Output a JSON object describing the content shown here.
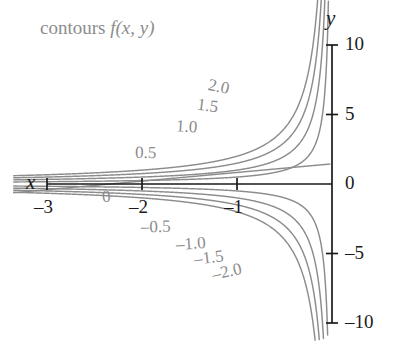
{
  "figure": {
    "caption_label": "contours",
    "caption_func": "f(x, y)",
    "x_axis_name": "x",
    "y_axis_name": "y",
    "contour_color": "#8c8c8c",
    "axis_color": "#1a1a1a",
    "background": "#ffffff"
  },
  "axes": {
    "x_ticks": [
      {
        "value": -3,
        "label": "–3"
      },
      {
        "value": -2,
        "label": "–2"
      },
      {
        "value": -1,
        "label": "–1"
      }
    ],
    "y_ticks": [
      {
        "value": 10,
        "label": "10"
      },
      {
        "value": 5,
        "label": "5"
      },
      {
        "value": 0,
        "label": "0"
      },
      {
        "value": -5,
        "label": "–5"
      },
      {
        "value": -10,
        "label": "–10"
      }
    ],
    "xlim": [
      -3.2,
      0.05
    ],
    "ylim": [
      -11.5,
      11.5
    ]
  },
  "chart_data": {
    "type": "line",
    "title": "contours f(x, y)",
    "xlabel": "x",
    "ylabel": "y",
    "grid": false,
    "legend": "inline-curve-labels",
    "curve_family": "y = c / x",
    "xlim": [
      -3.2,
      0.05
    ],
    "ylim": [
      -11.5,
      11.5
    ],
    "x_tick_values": [
      -3,
      -2,
      -1
    ],
    "x_tick_labels": [
      "–3",
      "–2",
      "–1"
    ],
    "y_tick_values": [
      10,
      5,
      0,
      -5,
      -10
    ],
    "y_tick_labels": [
      "10",
      "5",
      "0",
      "–5",
      "–10"
    ],
    "series": [
      {
        "name": "2.0",
        "level": 2.0,
        "label": "2.0",
        "label_x": -1.18,
        "label_y": 7.0
      },
      {
        "name": "1.5",
        "level": 1.5,
        "label": "1.5",
        "label_x": -1.3,
        "label_y": 5.6
      },
      {
        "name": "1.0",
        "level": 1.0,
        "label": "1.0",
        "label_x": -1.52,
        "label_y": 4.1
      },
      {
        "name": "0.5",
        "level": 0.5,
        "label": "0.5",
        "label_x": -1.95,
        "label_y": 2.2
      },
      {
        "name": "0",
        "level": 0.0,
        "label": "0",
        "label_x": -2.3,
        "label_y": -0.9
      },
      {
        "name": "-0.5",
        "level": -0.5,
        "label": "–0.5",
        "label_x": -1.88,
        "label_y": -3.1
      },
      {
        "name": "-1.0",
        "level": -1.0,
        "label": "–1.0",
        "label_x": -1.52,
        "label_y": -4.3
      },
      {
        "name": "-1.5",
        "level": -1.5,
        "label": "–1.5",
        "label_x": -1.33,
        "label_y": -5.3
      },
      {
        "name": "-2.0",
        "level": -2.0,
        "label": "–2.0",
        "label_x": -1.14,
        "label_y": -6.3
      }
    ]
  }
}
